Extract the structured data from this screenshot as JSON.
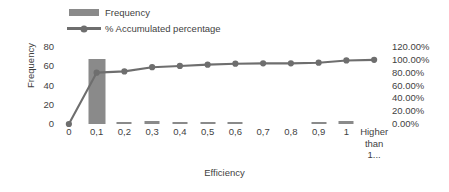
{
  "chart_data": {
    "type": "bar",
    "title": "",
    "xlabel": "Efficiency",
    "ylabel": "Frequency",
    "categories": [
      "0",
      "0,1",
      "0,2",
      "0,3",
      "0,4",
      "0,5",
      "0,6",
      "0,7",
      "0,8",
      "0,9",
      "1",
      "Higher than 1..."
    ],
    "series": [
      {
        "name": "Frequency",
        "type": "bar",
        "axis": "left",
        "values": [
          0,
          68,
          1,
          3,
          1,
          1,
          1,
          0,
          0,
          1,
          3,
          0
        ]
      },
      {
        "name": "% Accumulated percentage",
        "type": "line",
        "axis": "right",
        "values": [
          0.0,
          0.8,
          0.82,
          0.885,
          0.905,
          0.925,
          0.94,
          0.945,
          0.945,
          0.955,
          0.99,
          1.0
        ]
      }
    ],
    "ylim": [
      0,
      80
    ],
    "yticks": [
      0,
      20,
      40,
      60,
      80
    ],
    "y2lim": [
      0,
      1.2
    ],
    "y2ticks": [
      "0.00%",
      "20.00%",
      "40.00%",
      "60.00%",
      "80.00%",
      "100.00%",
      "120.00%"
    ],
    "grid": false,
    "legend_position": "top-left",
    "colors": {
      "bar": "#8a8a8a",
      "line": "#6e6e6e",
      "text": "#3f3f3f",
      "background": "#ffffff"
    }
  },
  "axes": {
    "y_left": {
      "title": "Frequency",
      "ticks": [
        {
          "label": "80",
          "value": 80
        },
        {
          "label": "60",
          "value": 60
        },
        {
          "label": "40",
          "value": 40
        },
        {
          "label": "20",
          "value": 20
        },
        {
          "label": "0",
          "value": 0
        }
      ]
    },
    "y_right": {
      "ticks": [
        {
          "label": "120.00%",
          "value": 1.2
        },
        {
          "label": "100.00%",
          "value": 1.0
        },
        {
          "label": "80.00%",
          "value": 0.8
        },
        {
          "label": "60.00%",
          "value": 0.6
        },
        {
          "label": "40.00%",
          "value": 0.4
        },
        {
          "label": "20.00%",
          "value": 0.2
        },
        {
          "label": "0.00%",
          "value": 0.0
        }
      ]
    },
    "x": {
      "title": "Efficiency",
      "labels": [
        {
          "line1": "0",
          "line2": "",
          "line3": ""
        },
        {
          "line1": "0,1",
          "line2": "",
          "line3": ""
        },
        {
          "line1": "0,2",
          "line2": "",
          "line3": ""
        },
        {
          "line1": "0,3",
          "line2": "",
          "line3": ""
        },
        {
          "line1": "0,4",
          "line2": "",
          "line3": ""
        },
        {
          "line1": "0,5",
          "line2": "",
          "line3": ""
        },
        {
          "line1": "0,6",
          "line2": "",
          "line3": ""
        },
        {
          "line1": "0,7",
          "line2": "",
          "line3": ""
        },
        {
          "line1": "0,8",
          "line2": "",
          "line3": ""
        },
        {
          "line1": "0,9",
          "line2": "",
          "line3": ""
        },
        {
          "line1": "1",
          "line2": "",
          "line3": ""
        },
        {
          "line1": "Higher",
          "line2": "than",
          "line3": "1..."
        }
      ]
    }
  },
  "legend": {
    "entries": [
      {
        "label": "Frequency",
        "marker": "bar-swatch-icon"
      },
      {
        "label": "% Accumulated percentage",
        "marker": "line-marker-icon"
      }
    ]
  }
}
